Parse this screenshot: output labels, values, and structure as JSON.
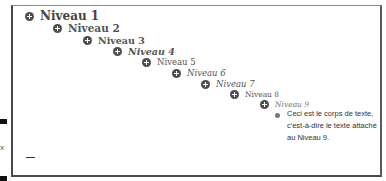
{
  "levels": [
    {
      "label": "Niveau 1"
    },
    {
      "label": "Niveau 2"
    },
    {
      "label": "Niveau 3"
    },
    {
      "label": "Niveau 4"
    },
    {
      "label": "Niveau 5"
    },
    {
      "label": "Niveau 6"
    },
    {
      "label": "Niveau 7"
    },
    {
      "label": "Niveau 8"
    },
    {
      "label": "Niveau 9"
    }
  ],
  "body_text": "Ceci est le corps de texte, c'est-à-dire le texte attaché au Niveau 9.",
  "side_mark": "x",
  "colors": {
    "icon": "#4d4d4d",
    "text": "#555555",
    "border": "#4a4a4a"
  }
}
